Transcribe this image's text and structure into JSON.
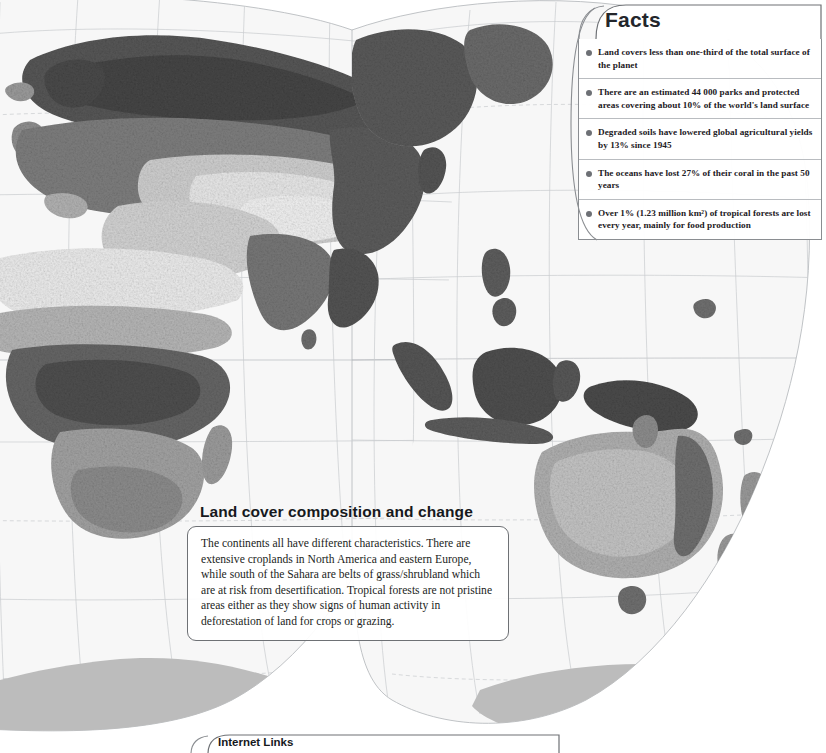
{
  "page": {
    "title": "Land cover composition and change",
    "background_color": "#ffffff"
  },
  "map": {
    "name": "world-land-cover-map",
    "projection": "interrupted-goode-homolosine",
    "style": "grayscale-raster",
    "ocean_color": "#f7f7f7",
    "graticule_color": "#c2c5c8",
    "antarctica_color": "#bcbcbc",
    "land_palette": [
      "#3e3e3e",
      "#555555",
      "#6e6e6e",
      "#8a8a8a",
      "#a6a6a6",
      "#c0c0c0",
      "#d8d8d8",
      "#efefef"
    ]
  },
  "facts": {
    "title": "Facts",
    "items": [
      {
        "text": "Land covers less than one-third of the total surface of the planet"
      },
      {
        "text": "There are an estimated 44 000 parks and protected areas covering about 10% of the world's land surface"
      },
      {
        "text": "Degraded soils have lowered global agricultural yields by 13% since 1945"
      },
      {
        "text": "The oceans have lost 27% of their coral in the past 50 years"
      },
      {
        "text": "Over 1% (1.23 million km²) of tropical forests are lost every year, mainly for food production"
      }
    ]
  },
  "landcover": {
    "title": "Land cover composition and change",
    "body": "The continents all have different characteristics. There are extensive croplands in North America and eastern Europe, while south of the Sahara are belts of grass/shrubland which are at risk from desertification. Tropical forests are not pristine areas either as they show signs of human activity in deforestation of land for crops or grazing."
  },
  "internet_links": {
    "title": "Internet Links"
  }
}
